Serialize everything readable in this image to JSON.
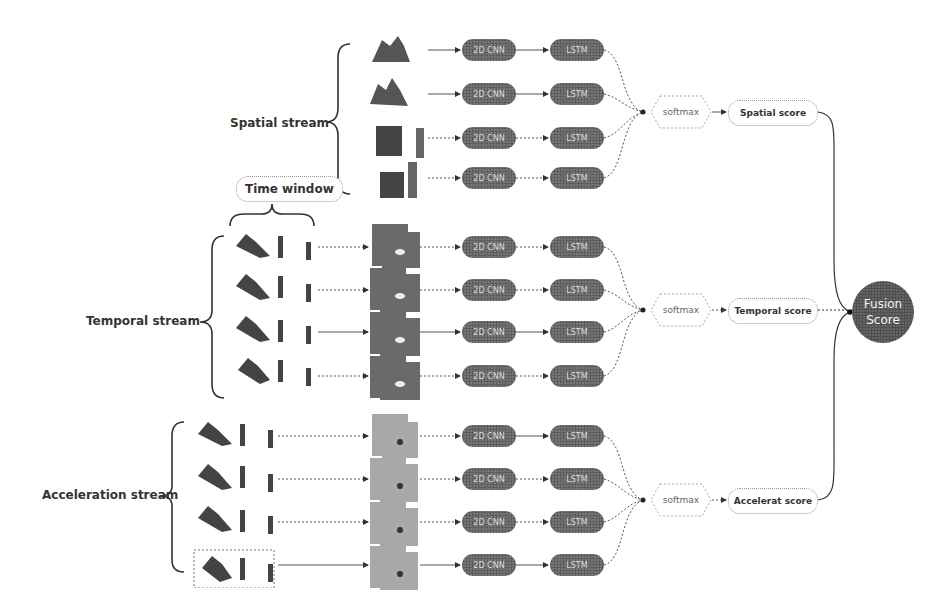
{
  "diagram": {
    "type": "multi-stream CNN-LSTM fusion architecture",
    "streams": [
      {
        "id": "spatial",
        "label": "Spatial stream",
        "rows": 4,
        "input": "single silhouette frames",
        "cnn_label": "2D CNN",
        "lstm_label": "LSTM",
        "softmax_label": "softmax",
        "score_label": "Spatial score"
      },
      {
        "id": "temporal",
        "label": "Temporal  stream",
        "rows": 4,
        "input": "stacked frames over time window -> optical flow maps",
        "cnn_label": "2D CNN",
        "lstm_label": "LSTM",
        "softmax_label": "softmax",
        "score_label": "Temporal  score"
      },
      {
        "id": "acceleration",
        "label": "Acceleration stream",
        "rows": 4,
        "input": "stacked frames -> acceleration maps",
        "cnn_label": "2D CNN",
        "lstm_label": "LSTM",
        "softmax_label": "softmax",
        "score_label": "Accelerat score"
      }
    ],
    "time_window_label": "Time window",
    "fusion": {
      "line1": "Fusion",
      "line2": "Score"
    },
    "colors": {
      "pill_fill": "#6f6f6f",
      "fusion_fill": "#5f5f5f",
      "flow_dark": "#6a6a6a",
      "flow_light": "#a8a8a8",
      "wire": "#555555"
    }
  }
}
